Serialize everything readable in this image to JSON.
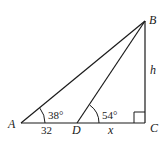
{
  "figure": {
    "type": "right-triangle-geometry",
    "vertices": {
      "A": {
        "label": "A"
      },
      "B": {
        "label": "B"
      },
      "C": {
        "label": "C"
      },
      "D": {
        "label": "D"
      }
    },
    "segments": [
      {
        "from": "A",
        "to": "B"
      },
      {
        "from": "D",
        "to": "B"
      },
      {
        "from": "B",
        "to": "C"
      },
      {
        "from": "A",
        "to": "C"
      }
    ],
    "labels": {
      "AD_length": "32",
      "DC_length": "x",
      "BC_length": "h"
    },
    "angles": {
      "A": "38°",
      "D": "54°",
      "C": "right-angle"
    },
    "colors": {
      "stroke": "#1a1a1a",
      "background": "#ffffff"
    }
  }
}
